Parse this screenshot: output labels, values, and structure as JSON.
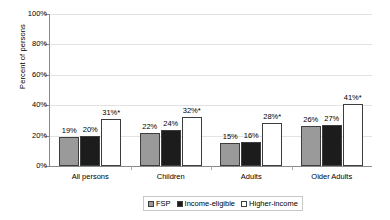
{
  "chart_data": {
    "type": "bar",
    "title": "",
    "xlabel": "",
    "ylabel": "Percent of persons",
    "ylim": [
      0,
      100
    ],
    "yticks": [
      "0%",
      "20%",
      "40%",
      "60%",
      "80%",
      "100%"
    ],
    "ytick_values": [
      0,
      20,
      40,
      60,
      80,
      100
    ],
    "grid": true,
    "legend_position": "bottom",
    "categories": [
      "All persons",
      "Children",
      "Adults",
      "Older Adults"
    ],
    "series": [
      {
        "name": "FSP",
        "color": "#9a9a9a",
        "values": [
          19,
          22,
          15,
          26
        ],
        "labels": [
          "19%",
          "22%",
          "15%",
          "26%"
        ]
      },
      {
        "name": "Income-eligible",
        "color": "#1c1c1c",
        "values": [
          20,
          24,
          16,
          27
        ],
        "labels": [
          "20%",
          "24%",
          "16%",
          "27%"
        ]
      },
      {
        "name": "Higher-income",
        "color": "#ffffff",
        "values": [
          31,
          32,
          28,
          41
        ],
        "labels": [
          "31%*",
          "32%*",
          "28%*",
          "41%*"
        ]
      }
    ]
  }
}
